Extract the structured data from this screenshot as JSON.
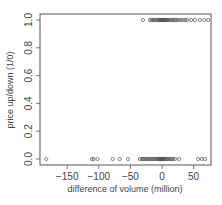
{
  "chart_data": {
    "type": "scatter",
    "title": "",
    "xlabel": "difference of volume (million)",
    "ylabel": "price up/down (1/0)",
    "xlim": [
      -190,
      78
    ],
    "ylim": [
      -0.02,
      1.04
    ],
    "x_ticks": [
      -150,
      -100,
      -50,
      0,
      50
    ],
    "x_tick_labels": [
      "−150",
      "−100",
      "−50",
      "0",
      "50"
    ],
    "y_ticks": [
      0.0,
      0.2,
      0.4,
      0.6,
      0.8,
      1.0
    ],
    "y_tick_labels": [
      "0.0",
      "0.2",
      "0.4",
      "0.6",
      "0.8",
      "1.0"
    ],
    "grid": false,
    "legend": null,
    "marker": "open-circle",
    "colors": {
      "points": "#555555",
      "axis": "#555555",
      "text": "#444444"
    },
    "series": [
      {
        "name": "up (1)",
        "y": 1,
        "x": [
          -30,
          -19,
          -17,
          -15,
          -13,
          -11,
          -9,
          -7,
          -5,
          -4,
          -3,
          -2,
          -1,
          0,
          1,
          2,
          3,
          4,
          5,
          6,
          7,
          8,
          10,
          12,
          14,
          16,
          18,
          20,
          22,
          25,
          28,
          31,
          34,
          37,
          40,
          46,
          52,
          60,
          67,
          73
        ]
      },
      {
        "name": "down (0)",
        "y": 0,
        "x": [
          -183,
          -111,
          -108,
          -102,
          -78,
          -67,
          -54,
          -35,
          -32,
          -30,
          -28,
          -26,
          -24,
          -22,
          -20,
          -18,
          -16,
          -14,
          -12,
          -10,
          -8,
          -6,
          -5,
          -4,
          -3,
          -2,
          -1,
          0,
          1,
          2,
          3,
          4,
          5,
          6,
          8,
          10,
          12,
          14,
          16,
          18,
          21,
          27,
          57,
          63,
          68
        ]
      }
    ]
  }
}
